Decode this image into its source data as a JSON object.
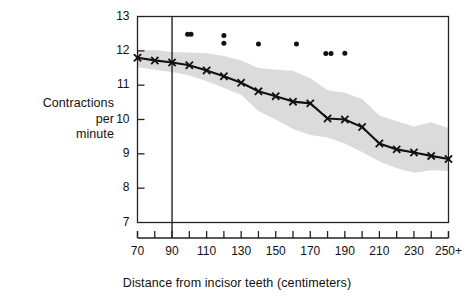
{
  "chart_data": {
    "type": "line",
    "title": "",
    "xlabel": "Distance from incisor teeth (centimeters)",
    "ylabel": "Contractions per minute",
    "ylabel_lines": [
      "Contractions",
      "per",
      "minute"
    ],
    "xlim": [
      70,
      250
    ],
    "ylim": [
      7,
      13
    ],
    "grid": false,
    "legend": "none",
    "yticks": [
      7,
      8,
      9,
      10,
      11,
      12,
      13
    ],
    "ytick_labels": [
      "7",
      "8",
      "9",
      "10",
      "11",
      "12",
      "13"
    ],
    "xticks": [
      70,
      80,
      90,
      100,
      110,
      120,
      130,
      140,
      150,
      160,
      170,
      180,
      190,
      200,
      210,
      220,
      230,
      240,
      250
    ],
    "xtick_labels": [
      {
        "x": 70,
        "label": "70"
      },
      {
        "x": 90,
        "label": "90"
      },
      {
        "x": 110,
        "label": "110"
      },
      {
        "x": 130,
        "label": "130"
      },
      {
        "x": 150,
        "label": "150"
      },
      {
        "x": 170,
        "label": "170"
      },
      {
        "x": 190,
        "label": "190"
      },
      {
        "x": 210,
        "label": "210"
      },
      {
        "x": 230,
        "label": "230"
      },
      {
        "x": 250,
        "label": "250+"
      }
    ],
    "series": [
      {
        "name": "Mean contractions per minute",
        "marker": "x",
        "x": [
          70,
          80,
          90,
          100,
          110,
          120,
          130,
          140,
          150,
          160,
          170,
          180,
          190,
          200,
          210,
          220,
          230,
          240,
          250
        ],
        "values": [
          11.8,
          11.72,
          11.66,
          11.58,
          11.43,
          11.26,
          11.07,
          10.82,
          10.68,
          10.52,
          10.47,
          10.03,
          10.0,
          9.78,
          9.3,
          9.13,
          9.04,
          8.94,
          8.85
        ]
      },
      {
        "name": "Confidence band upper",
        "x": [
          70,
          80,
          90,
          100,
          110,
          120,
          130,
          140,
          150,
          160,
          170,
          180,
          190,
          200,
          210,
          220,
          230,
          240,
          250
        ],
        "values": [
          12.0,
          12.02,
          11.97,
          11.95,
          11.93,
          11.85,
          11.72,
          11.5,
          11.45,
          11.42,
          11.2,
          10.85,
          10.78,
          10.6,
          10.12,
          9.95,
          9.8,
          9.92,
          9.75
        ]
      },
      {
        "name": "Confidence band lower",
        "x": [
          70,
          80,
          90,
          100,
          110,
          120,
          130,
          140,
          150,
          160,
          170,
          180,
          190,
          200,
          210,
          220,
          230,
          240,
          250
        ],
        "values": [
          11.52,
          11.45,
          11.38,
          11.28,
          11.12,
          10.92,
          10.72,
          10.25,
          10.0,
          9.72,
          9.55,
          9.48,
          9.3,
          9.05,
          8.78,
          8.58,
          8.45,
          8.52,
          8.5
        ]
      }
    ],
    "scatter_points": {
      "name": "Outlier observations",
      "marker": "dot",
      "points": [
        {
          "x": 99,
          "y": 12.48
        },
        {
          "x": 101,
          "y": 12.48
        },
        {
          "x": 120,
          "y": 12.45
        },
        {
          "x": 120,
          "y": 12.22
        },
        {
          "x": 140,
          "y": 12.2
        },
        {
          "x": 162,
          "y": 12.2
        },
        {
          "x": 179,
          "y": 11.92
        },
        {
          "x": 182,
          "y": 11.92
        },
        {
          "x": 190,
          "y": 11.93
        }
      ]
    },
    "reference_line": {
      "name": "vertical-reference-line",
      "x": 90,
      "orientation": "vertical"
    },
    "colors": {
      "line": "#111111",
      "band": "#d9d9d9",
      "axis": "#222222",
      "text": "#111111",
      "background": "#ffffff"
    }
  }
}
